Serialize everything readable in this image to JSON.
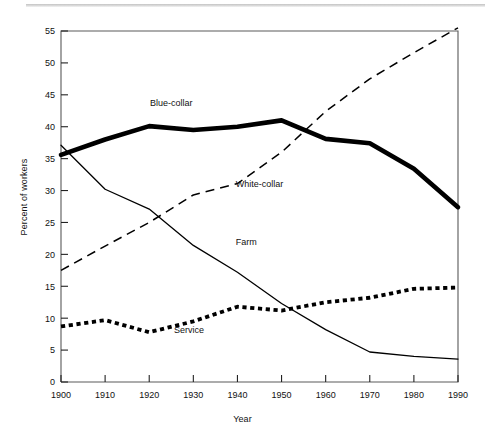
{
  "chart_data": {
    "type": "line",
    "title": "",
    "xlabel": "Year",
    "ylabel": "Percent of workers",
    "x": [
      1900,
      1910,
      1920,
      1930,
      1940,
      1950,
      1960,
      1970,
      1980,
      1990
    ],
    "xlim": [
      1900,
      1990
    ],
    "ylim": [
      0,
      55
    ],
    "xticks": [
      "1900",
      "1910",
      "1920",
      "1930",
      "1940",
      "1950",
      "1960",
      "1970",
      "1980",
      "1990"
    ],
    "yticks": [
      "0",
      "5",
      "10",
      "15",
      "20",
      "25",
      "30",
      "35",
      "40",
      "45",
      "50",
      "55"
    ],
    "grid": false,
    "legend_position": "inline-labels",
    "series": [
      {
        "name": "Blue-collar",
        "style": "thick-solid",
        "color": "#000000",
        "label_x": 1925,
        "label_y": 43.2,
        "values": [
          35.6,
          38.0,
          40.1,
          39.5,
          40.0,
          41.0,
          38.1,
          37.4,
          33.4,
          27.4
        ]
      },
      {
        "name": "White-collar",
        "style": "dashed",
        "color": "#000000",
        "label_x": 1945,
        "label_y": 30.5,
        "values": [
          17.5,
          21.3,
          25.0,
          29.3,
          31.1,
          36.0,
          42.4,
          47.5,
          51.6,
          55.5
        ]
      },
      {
        "name": "Farm",
        "style": "thin-solid",
        "color": "#000000",
        "label_x": 1942,
        "label_y": 21.4,
        "values": [
          37.1,
          30.2,
          27.1,
          21.4,
          17.2,
          12.3,
          8.2,
          4.7,
          4.0,
          3.6
        ]
      },
      {
        "name": "Service",
        "style": "dotted",
        "color": "#000000",
        "label_x": 1929,
        "label_y": 7.6,
        "values": [
          8.7,
          9.7,
          7.8,
          9.5,
          11.8,
          11.2,
          12.5,
          13.2,
          14.6,
          14.8
        ]
      }
    ]
  },
  "axes": {
    "x_title": "Year",
    "y_title": "Percent of workers"
  }
}
